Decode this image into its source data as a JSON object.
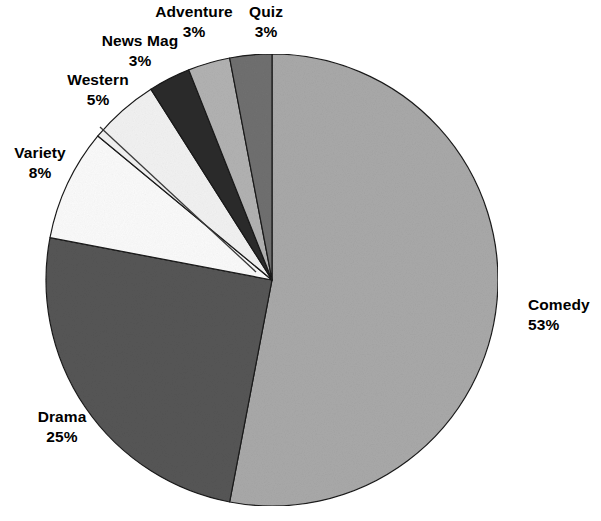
{
  "chart_data": {
    "type": "pie",
    "title": "",
    "subtitle": "",
    "xlabel": "",
    "ylabel": "",
    "legend_position": "none",
    "grid": false,
    "labels_show_percent": true,
    "start_angle_deg": 0,
    "direction": "clockwise",
    "categories": [
      "Comedy",
      "Drama",
      "Variety",
      "Western",
      "News Mag",
      "Adventure",
      "Quiz"
    ],
    "values": [
      53,
      25,
      8,
      5,
      3,
      3,
      3
    ],
    "units": "%",
    "slices": [
      {
        "label": "Comedy",
        "percent_text": "53%",
        "value": 53,
        "color": "#a9a9a9",
        "label_position": "right"
      },
      {
        "label": "Drama",
        "percent_text": "25%",
        "value": 25,
        "color": "#565656",
        "label_position": "bottom-left"
      },
      {
        "label": "Variety",
        "percent_text": "8%",
        "value": 8,
        "color": "#fbfbfb",
        "label_position": "left",
        "leader_line": true
      },
      {
        "label": "Western",
        "percent_text": "5%",
        "value": 5,
        "color": "#f2f2f2",
        "label_position": "upper-left"
      },
      {
        "label": "News Mag",
        "percent_text": "3%",
        "value": 3,
        "color": "#2b2b2b",
        "label_position": "top-left"
      },
      {
        "label": "Adventure",
        "percent_text": "3%",
        "value": 3,
        "color": "#b2b2b2",
        "label_position": "top"
      },
      {
        "label": "Quiz",
        "percent_text": "3%",
        "value": 3,
        "color": "#707070",
        "label_position": "top-right"
      }
    ],
    "geometry": {
      "center_x": 272,
      "center_y": 280,
      "radius": 226
    },
    "colors": {
      "background": "#ffffff",
      "outline": "#1a1a1a",
      "text": "#000000"
    }
  },
  "labels": {
    "comedy": {
      "name": "Comedy",
      "pct": "53%"
    },
    "drama": {
      "name": "Drama",
      "pct": "25%"
    },
    "variety": {
      "name": "Variety",
      "pct": "8%"
    },
    "western": {
      "name": "Western",
      "pct": "5%"
    },
    "newsmag": {
      "name": "News Mag",
      "pct": "3%"
    },
    "adventure": {
      "name": "Adventure",
      "pct": "3%"
    },
    "quiz": {
      "name": "Quiz",
      "pct": "3%"
    }
  }
}
